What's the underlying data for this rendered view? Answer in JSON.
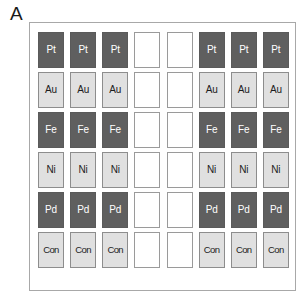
{
  "panel": {
    "label": "A",
    "type": "microplate-layout-diagram"
  },
  "colors": {
    "well_dark_fill": "#5f5f5f",
    "well_dark_text": "#ffffff",
    "well_light_fill": "#e0e0e0",
    "well_light_text": "#1c1c1c",
    "well_empty_fill": "#ffffff",
    "well_border_light": "#8d8d8d",
    "well_border_empty": "#9a9a9a",
    "plate_border": "#a8a8a8",
    "background": "#ffffff"
  },
  "grid": {
    "columns": 8,
    "rows": 6,
    "row_labels": [
      "Pt",
      "Au",
      "Fe",
      "Ni",
      "Pd",
      "Con"
    ],
    "cells": [
      [
        {
          "label": "Pt",
          "style": "dark"
        },
        {
          "label": "Pt",
          "style": "dark"
        },
        {
          "label": "Pt",
          "style": "dark"
        },
        {
          "label": "",
          "style": "empty"
        },
        {
          "label": "",
          "style": "empty"
        },
        {
          "label": "Pt",
          "style": "dark"
        },
        {
          "label": "Pt",
          "style": "dark"
        },
        {
          "label": "Pt",
          "style": "dark"
        }
      ],
      [
        {
          "label": "Au",
          "style": "light"
        },
        {
          "label": "Au",
          "style": "light"
        },
        {
          "label": "Au",
          "style": "light"
        },
        {
          "label": "",
          "style": "empty"
        },
        {
          "label": "",
          "style": "empty"
        },
        {
          "label": "Au",
          "style": "light"
        },
        {
          "label": "Au",
          "style": "light"
        },
        {
          "label": "Au",
          "style": "light"
        }
      ],
      [
        {
          "label": "Fe",
          "style": "dark"
        },
        {
          "label": "Fe",
          "style": "dark"
        },
        {
          "label": "Fe",
          "style": "dark"
        },
        {
          "label": "",
          "style": "empty"
        },
        {
          "label": "",
          "style": "empty"
        },
        {
          "label": "Fe",
          "style": "dark"
        },
        {
          "label": "Fe",
          "style": "dark"
        },
        {
          "label": "Fe",
          "style": "dark"
        }
      ],
      [
        {
          "label": "Ni",
          "style": "light"
        },
        {
          "label": "Ni",
          "style": "light"
        },
        {
          "label": "Ni",
          "style": "light"
        },
        {
          "label": "",
          "style": "empty"
        },
        {
          "label": "",
          "style": "empty"
        },
        {
          "label": "Ni",
          "style": "light"
        },
        {
          "label": "Ni",
          "style": "light"
        },
        {
          "label": "Ni",
          "style": "light"
        }
      ],
      [
        {
          "label": "Pd",
          "style": "dark"
        },
        {
          "label": "Pd",
          "style": "dark"
        },
        {
          "label": "Pd",
          "style": "dark"
        },
        {
          "label": "",
          "style": "empty"
        },
        {
          "label": "",
          "style": "empty"
        },
        {
          "label": "Pd",
          "style": "dark"
        },
        {
          "label": "Pd",
          "style": "dark"
        },
        {
          "label": "Pd",
          "style": "dark"
        }
      ],
      [
        {
          "label": "Con",
          "style": "light"
        },
        {
          "label": "Con",
          "style": "light"
        },
        {
          "label": "Con",
          "style": "light"
        },
        {
          "label": "",
          "style": "empty"
        },
        {
          "label": "",
          "style": "empty"
        },
        {
          "label": "Con",
          "style": "light"
        },
        {
          "label": "Con",
          "style": "light"
        },
        {
          "label": "Con",
          "style": "light"
        }
      ]
    ]
  }
}
